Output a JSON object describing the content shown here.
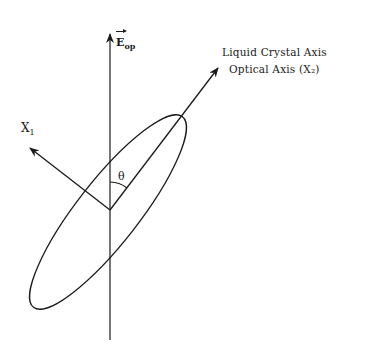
{
  "diagram": {
    "type": "liquid-crystal-optical-axis-schematic",
    "labels": {
      "field_vector": "E",
      "field_subscript": "op",
      "liquid_crystal_axis": "Liquid Crystal Axis",
      "optical_axis": "Optical Axis (X₂)",
      "x1_main": "X",
      "x1_subscript": "1",
      "angle": "θ"
    },
    "geometry": {
      "origin": [
        110,
        210
      ],
      "vertical_axis_top": [
        110,
        33
      ],
      "vertical_axis_bottom": [
        110,
        340
      ],
      "optical_axis_tip": [
        218,
        68
      ],
      "x1_axis_tip": [
        30,
        148
      ],
      "ellipse_center": [
        108,
        212
      ],
      "ellipse_semi_major": 121,
      "ellipse_semi_minor": 31,
      "ellipse_rotation_deg": -52
    },
    "colors": {
      "stroke": "#1a1a1a",
      "background": "#ffffff"
    }
  }
}
